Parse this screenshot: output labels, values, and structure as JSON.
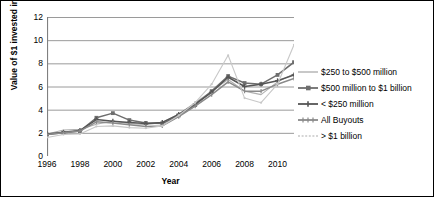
{
  "chart_data": {
    "type": "line",
    "title": "",
    "xlabel": "Year",
    "ylabel": "Value of $1 invested in 1995",
    "xlim": [
      1996,
      2011
    ],
    "ylim": [
      0,
      12
    ],
    "ytick_labels": [
      "0",
      "2",
      "4",
      "6",
      "8",
      "10",
      "12"
    ],
    "ytick_values": [
      0,
      2,
      4,
      6,
      8,
      10,
      12
    ],
    "xtick_labels": [
      "1996",
      "1998",
      "2000",
      "2002",
      "2004",
      "2006",
      "2008",
      "2010"
    ],
    "xtick_values": [
      1996,
      1998,
      2000,
      2002,
      2004,
      2006,
      2008,
      2010
    ],
    "grid": "horizontal",
    "legend_position": "right",
    "x": [
      1996,
      1997,
      1998,
      1999,
      2000,
      2001,
      2002,
      2003,
      2004,
      2005,
      2006,
      2007,
      2008,
      2009,
      2010,
      2011
    ],
    "series": [
      {
        "name": "$250 to $500 million",
        "color": "#b0b0b0",
        "marker": "none",
        "values": [
          1.9,
          2.25,
          2.3,
          2.75,
          3.0,
          2.8,
          2.7,
          2.9,
          3.6,
          4.6,
          5.6,
          6.6,
          5.6,
          5.3,
          6.4,
          7.1
        ]
      },
      {
        "name": "$500 million to $1 billion",
        "color": "#6e6e6e",
        "marker": "square",
        "values": [
          1.85,
          2.0,
          2.15,
          3.3,
          3.7,
          3.1,
          2.85,
          2.8,
          3.5,
          4.4,
          5.6,
          6.9,
          6.3,
          6.2,
          7.0,
          8.1
        ]
      },
      {
        "name": "< $250 million",
        "color": "#555555",
        "marker": "plus",
        "values": [
          1.9,
          2.05,
          2.2,
          3.15,
          3.0,
          2.9,
          2.8,
          2.9,
          3.6,
          4.5,
          5.5,
          6.8,
          6.0,
          6.2,
          6.5,
          7.0
        ]
      },
      {
        "name": "All Buyouts",
        "color": "#8a8a8a",
        "marker": "tick",
        "values": [
          1.85,
          2.0,
          2.15,
          2.95,
          2.85,
          2.7,
          2.55,
          2.6,
          3.4,
          4.3,
          5.3,
          6.4,
          5.6,
          5.6,
          6.2,
          6.7
        ]
      },
      {
        "name": "> $1 billion",
        "color": "#c8c8c8",
        "marker": "dot",
        "values": [
          1.6,
          1.85,
          1.9,
          2.55,
          2.6,
          2.45,
          2.4,
          2.6,
          3.5,
          4.6,
          6.2,
          8.7,
          5.0,
          4.6,
          6.2,
          9.6
        ]
      }
    ]
  }
}
